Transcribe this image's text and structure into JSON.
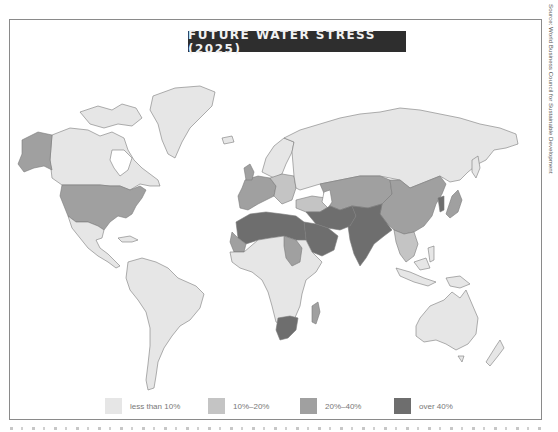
{
  "title": "FUTURE WATER STRESS (2025)",
  "source": "Source: World Business Council for Sustainable Development",
  "legend": [
    {
      "label": "less than 10%",
      "color": "#e6e6e6"
    },
    {
      "label": "10%–20%",
      "color": "#c4c4c4"
    },
    {
      "label": "20%–40%",
      "color": "#a0a0a0"
    },
    {
      "label": "over 40%",
      "color": "#6e6e6e"
    }
  ],
  "colors": {
    "ocean": "#ffffff",
    "border": "#7a7a7a",
    "title_bg": "#2e2e2e",
    "title_fg": "#f2f2f2"
  },
  "regions": [
    {
      "name": "Canada",
      "category": "less than 10%"
    },
    {
      "name": "Greenland",
      "category": "less than 10%"
    },
    {
      "name": "Alaska",
      "category": "20%–40%"
    },
    {
      "name": "United States",
      "category": "20%–40%"
    },
    {
      "name": "Mexico & Central America",
      "category": "less than 10%"
    },
    {
      "name": "South America",
      "category": "less than 10%"
    },
    {
      "name": "Russia",
      "category": "less than 10%"
    },
    {
      "name": "Scandinavia",
      "category": "less than 10%"
    },
    {
      "name": "Western Europe",
      "category": "20%–40%"
    },
    {
      "name": "Eastern Europe",
      "category": "10%–20%"
    },
    {
      "name": "North Africa",
      "category": "over 40%"
    },
    {
      "name": "Arabian Peninsula",
      "category": "over 40%"
    },
    {
      "name": "Middle East / Iran",
      "category": "over 40%"
    },
    {
      "name": "Central Asia",
      "category": "20%–40%"
    },
    {
      "name": "South Asia (India/Pakistan)",
      "category": "over 40%"
    },
    {
      "name": "China",
      "category": "20%–40%"
    },
    {
      "name": "Southeast Asia",
      "category": "10%–20%"
    },
    {
      "name": "Sub-Saharan Africa",
      "category": "less than 10%"
    },
    {
      "name": "Sudan",
      "category": "20%–40%"
    },
    {
      "name": "West Africa (Mauritania)",
      "category": "20%–40%"
    },
    {
      "name": "South Africa",
      "category": "over 40%"
    },
    {
      "name": "Madagascar",
      "category": "20%–40%"
    },
    {
      "name": "Japan",
      "category": "20%–40%"
    },
    {
      "name": "Australia",
      "category": "less than 10%"
    },
    {
      "name": "New Zealand",
      "category": "less than 10%"
    },
    {
      "name": "Indonesia / Papua",
      "category": "less than 10%"
    }
  ]
}
